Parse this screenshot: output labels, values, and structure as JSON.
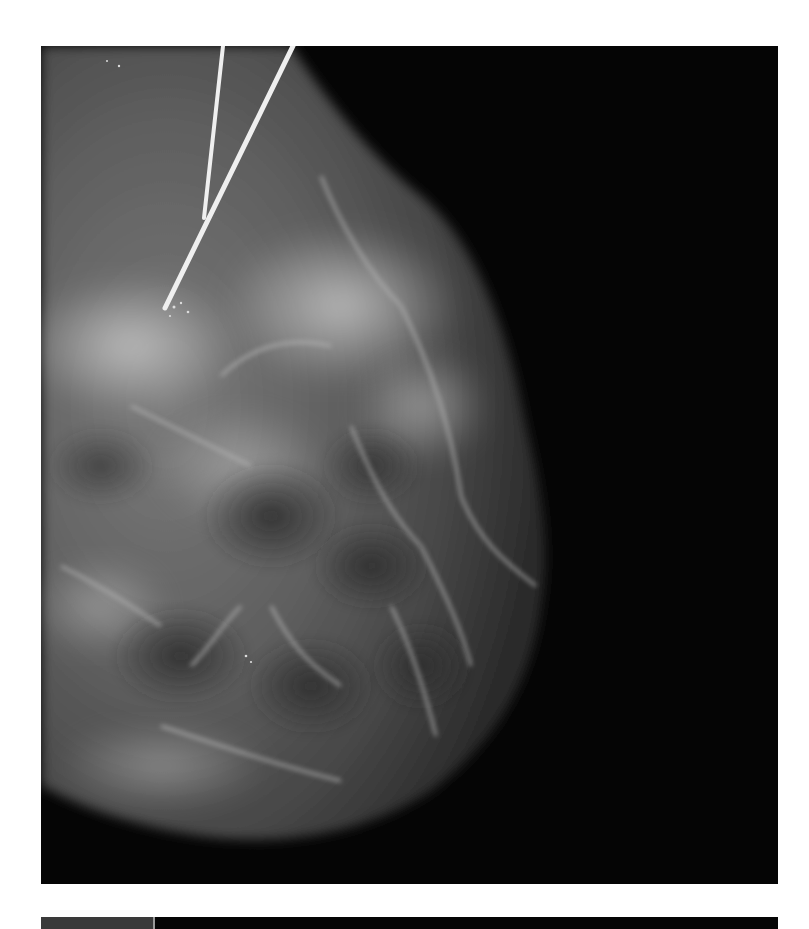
{
  "figure": {
    "type": "mammogram",
    "view": "breast radiograph with localization wires",
    "colors": {
      "background": "#050505",
      "tissue_dark": "#3c3c3c",
      "tissue_mid": "#6e6e6e",
      "tissue_bright": "#bdbdbd",
      "wire": "#eeeeee",
      "page": "#ffffff"
    },
    "annotations": {
      "wire_count": 2
    }
  },
  "lower_figure": {
    "visible": "top edge only"
  }
}
